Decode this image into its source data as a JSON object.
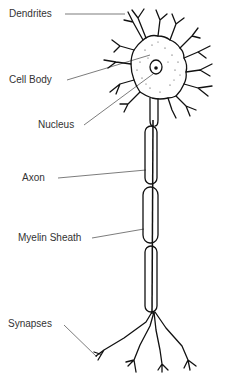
{
  "diagram": {
    "labels": {
      "dendrites": "Dendrites",
      "cell_body": "Cell Body",
      "nucleus": "Nucleus",
      "axon": "Axon",
      "myelin_sheath": "Myelin Sheath",
      "synapses": "Synapses"
    },
    "colors": {
      "ink": "#111111",
      "text": "#333333",
      "background": "#ffffff"
    }
  }
}
